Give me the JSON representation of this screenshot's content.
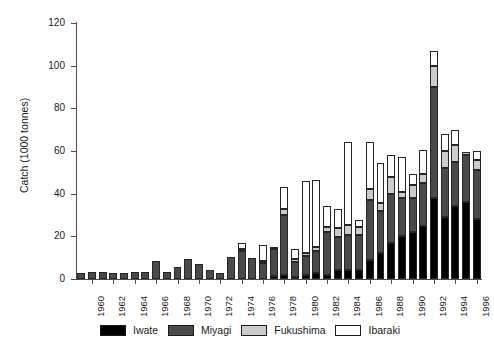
{
  "chart_data": {
    "type": "bar",
    "subtype": "stacked-vertical",
    "title": "",
    "xlabel": "",
    "ylabel": "Catch (1000 tonnes)",
    "ylim": [
      0,
      120
    ],
    "yticks": [
      0,
      20,
      40,
      60,
      80,
      100,
      120
    ],
    "ytick_labels": [
      "0",
      "20",
      "40",
      "60",
      "80",
      "100",
      "120"
    ],
    "grid": false,
    "legend_position": "bottom",
    "x": [
      1959,
      1960,
      1961,
      1962,
      1963,
      1964,
      1965,
      1966,
      1967,
      1968,
      1969,
      1970,
      1971,
      1972,
      1973,
      1974,
      1975,
      1976,
      1977,
      1978,
      1979,
      1980,
      1981,
      1982,
      1983,
      1984,
      1985,
      1986,
      1987,
      1988,
      1989,
      1990,
      1991,
      1992,
      1993,
      1994,
      1995,
      1996
    ],
    "xtick_labels": [
      "1960",
      "1962",
      "1964",
      "1966",
      "1968",
      "1970",
      "1972",
      "1974",
      "1976",
      "1978",
      "1980",
      "1982",
      "1984",
      "1986",
      "1988",
      "1990",
      "1992",
      "1994",
      "1996"
    ],
    "categories": [
      "1959",
      "1960",
      "1961",
      "1962",
      "1963",
      "1964",
      "1965",
      "1966",
      "1967",
      "1968",
      "1969",
      "1970",
      "1971",
      "1972",
      "1973",
      "1974",
      "1975",
      "1976",
      "1977",
      "1978",
      "1979",
      "1980",
      "1981",
      "1982",
      "1983",
      "1984",
      "1985",
      "1986",
      "1987",
      "1988",
      "1989",
      "1990",
      "1991",
      "1992",
      "1993",
      "1994",
      "1995",
      "1996"
    ],
    "series": [
      {
        "name": "Iwate",
        "color": "#000000",
        "values": [
          0,
          0,
          0,
          0,
          0,
          0,
          0,
          0,
          0,
          0,
          0,
          0,
          0,
          0,
          0,
          0,
          0,
          0,
          1.5,
          2.0,
          1.0,
          2.0,
          3.0,
          2.0,
          4.0,
          4.0,
          4.0,
          9.0,
          12.0,
          17.0,
          20.0,
          22.0,
          25.0,
          38.0,
          29.0,
          34.0,
          36.0,
          28.0
        ]
      },
      {
        "name": "Miyagi",
        "color": "#4a4a4a",
        "values": [
          3.0,
          3.5,
          3.2,
          3.0,
          3.0,
          3.2,
          3.2,
          8.5,
          3.5,
          5.5,
          9.5,
          7.0,
          4.0,
          3.0,
          10.5,
          13.0,
          10.0,
          7.5,
          12.5,
          28.0,
          7.0,
          9.0,
          10.0,
          20.0,
          15.5,
          16.5,
          16.5,
          28.0,
          20.0,
          23.0,
          18.0,
          16.0,
          20.0,
          52.0,
          23.0,
          21.0,
          22.0,
          23.0
        ]
      },
      {
        "name": "Fukushima",
        "color": "#cccccc",
        "values": [
          0,
          0,
          0,
          0,
          0,
          0,
          0,
          0,
          0,
          0,
          0,
          0,
          0,
          0,
          0,
          1.0,
          0,
          1.0,
          1.0,
          3.0,
          1.5,
          1.0,
          2.0,
          2.5,
          4.5,
          5.0,
          4.0,
          5.0,
          3.5,
          8.0,
          3.0,
          6.0,
          4.0,
          10.0,
          8.0,
          8.0,
          1.5,
          5.0
        ]
      },
      {
        "name": "Ibaraki",
        "color": "#ffffff",
        "values": [
          0,
          0,
          0,
          0,
          0,
          0,
          0,
          0,
          0,
          0,
          0,
          0,
          0,
          0,
          0,
          3.0,
          0,
          7.5,
          0,
          10.0,
          4.5,
          34.0,
          31.5,
          9.5,
          9.0,
          38.5,
          3.0,
          22.0,
          19.0,
          10.0,
          16.0,
          5.0,
          11.5,
          7.0,
          8.0,
          7.0,
          0,
          4.0
        ]
      }
    ]
  },
  "axes": {
    "ylabel": "Catch (1000 tonnes)"
  },
  "legend": {
    "items": [
      {
        "label": "Iwate",
        "color": "#000000"
      },
      {
        "label": "Miyagi",
        "color": "#4a4a4a"
      },
      {
        "label": "Fukushima",
        "color": "#cccccc"
      },
      {
        "label": "Ibaraki",
        "color": "#ffffff"
      }
    ]
  }
}
